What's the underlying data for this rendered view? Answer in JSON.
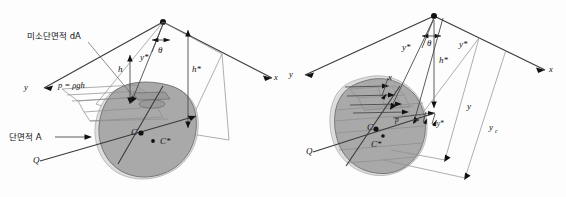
{
  "figure": {
    "description_type": "engineering-diagram",
    "panels": [
      {
        "id": "left",
        "labels": {
          "elemental_area": "미소단면적 dA",
          "area": "단면적 A",
          "pressure_formula": "p = ρgh",
          "depth_h": "h",
          "depth_h_star": "h*",
          "y_star": "y*",
          "theta": "θ",
          "axis_y": "y",
          "axis_x": "x",
          "centroid": "C",
          "center_of_pressure": "C*",
          "point_q": "Q"
        }
      },
      {
        "id": "right",
        "labels": {
          "depth_h_star": "h*",
          "y_star": "y*",
          "y_star_2": "y*",
          "y": "y",
          "y_c": "y",
          "y_c_sub": "c",
          "dy_star": "dy*",
          "theta": "θ",
          "axis_y": "y",
          "axis_x": "x",
          "width_x": "x",
          "pressure_p": "p",
          "centroid": "C",
          "center_of_pressure": "C*",
          "point_q": "Q"
        }
      }
    ]
  },
  "colors": {
    "plate_fill": "#a9a9a9",
    "plate_ghost": "#d8d8d8",
    "axis_stroke": "#3a3a3a",
    "thin_stroke": "#8d8d8d",
    "text": "#111111",
    "background": "#fdfdfd"
  }
}
